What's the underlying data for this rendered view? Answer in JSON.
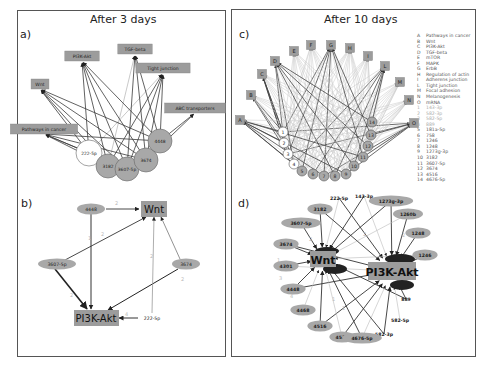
{
  "figure": {
    "left_title": "After 3 days",
    "right_title": "After 10 days",
    "panel_labels": {
      "a": "a)",
      "b": "b)",
      "c": "c)",
      "d": "d)"
    }
  },
  "panel_a": {
    "pathways": [
      {
        "label": "PI3K-Akt",
        "x": 82,
        "y": 56
      },
      {
        "label": "TGF-beta",
        "x": 135,
        "y": 49
      },
      {
        "label": "Tight junction",
        "x": 163,
        "y": 68
      },
      {
        "label": "Wnt",
        "x": 40,
        "y": 84
      },
      {
        "label": "ABC transporters",
        "x": 195,
        "y": 108
      },
      {
        "label": "Pathways in cancer",
        "x": 44,
        "y": 129
      }
    ],
    "mirnas": [
      {
        "label": "222-5p",
        "x": 89,
        "y": 153,
        "r": 13,
        "fill": "#ffffff"
      },
      {
        "label": "3182",
        "x": 108,
        "y": 166,
        "r": 12,
        "fill": "#a8a8a8"
      },
      {
        "label": "3607-5p",
        "x": 127,
        "y": 169,
        "r": 12,
        "fill": "#a8a8a8"
      },
      {
        "label": "3674",
        "x": 146,
        "y": 160,
        "r": 12,
        "fill": "#a8a8a8"
      },
      {
        "label": "4448",
        "x": 160,
        "y": 141,
        "r": 12,
        "fill": "#a8a8a8"
      }
    ]
  },
  "panel_b": {
    "targets": [
      {
        "label": "Wnt",
        "x": 154,
        "y": 209
      },
      {
        "label": "PI3K-Akt",
        "x": 96,
        "y": 318
      }
    ],
    "mirnas": [
      {
        "label": "4448",
        "x": 91,
        "y": 209
      },
      {
        "label": "3607-5p",
        "x": 57,
        "y": 264
      },
      {
        "label": "3674",
        "x": 186,
        "y": 264
      },
      {
        "label": "222-5p",
        "x": 152,
        "y": 318
      }
    ],
    "edge_weights": [
      "2",
      "2",
      "2",
      "2",
      "2",
      "4",
      "1"
    ]
  },
  "panel_c": {
    "pathway_nodes": [
      "A",
      "B",
      "C",
      "D",
      "E",
      "F",
      "G",
      "H",
      "I",
      "L",
      "M",
      "N",
      "O"
    ],
    "mirna_nodes": [
      "1",
      "2",
      "3",
      "4",
      "5",
      "6",
      "7",
      "8",
      "9",
      "10",
      "11",
      "12",
      "13",
      "14"
    ],
    "legend": [
      {
        "key": "A",
        "label": "Pathways in cancer"
      },
      {
        "key": "B",
        "label": "Wnt"
      },
      {
        "key": "C",
        "label": "PI3K-Akt"
      },
      {
        "key": "D",
        "label": "TGF-beta"
      },
      {
        "key": "E",
        "label": "mTOR"
      },
      {
        "key": "F",
        "label": "MAPK"
      },
      {
        "key": "G",
        "label": "ErbB"
      },
      {
        "key": "H",
        "label": "Regulation of actin"
      },
      {
        "key": "I",
        "label": "Adherens junction"
      },
      {
        "key": "L",
        "label": "Tight junction"
      },
      {
        "key": "M",
        "label": "Focal adhesion"
      },
      {
        "key": "N",
        "label": "Melanogenesis"
      },
      {
        "key": "O",
        "label": "mRNA"
      },
      {
        "key": "1",
        "label": "143-3p",
        "light": true
      },
      {
        "key": "2",
        "label": "582-3p",
        "light": true
      },
      {
        "key": "3",
        "label": "582-5p",
        "light": true
      },
      {
        "key": "4",
        "label": "889",
        "light": true
      },
      {
        "key": "5",
        "label": "181a-5p"
      },
      {
        "key": "6",
        "label": "758"
      },
      {
        "key": "7",
        "label": "1246"
      },
      {
        "key": "8",
        "label": "1248"
      },
      {
        "key": "9",
        "label": "1273g-3p"
      },
      {
        "key": "10",
        "label": "3182"
      },
      {
        "key": "11",
        "label": "3607-5p"
      },
      {
        "key": "12",
        "label": "3674"
      },
      {
        "key": "13",
        "label": "4516"
      },
      {
        "key": "14",
        "label": "4676-5p"
      }
    ]
  },
  "panel_d": {
    "hubs": [
      {
        "label": "Wnt",
        "x": 323,
        "y": 259
      },
      {
        "label": "PI3K-Akt",
        "x": 392,
        "y": 271
      }
    ],
    "mirnas": [
      {
        "label": "222-5p",
        "x": 339,
        "y": 198,
        "fill": "#ffffff"
      },
      {
        "label": "143-3p",
        "x": 364,
        "y": 196,
        "fill": "#ffffff"
      },
      {
        "label": "1273g-3p",
        "x": 391,
        "y": 201,
        "fill": "#a8a8a8"
      },
      {
        "label": "3182",
        "x": 320,
        "y": 209,
        "fill": "#a8a8a8"
      },
      {
        "label": "1260b",
        "x": 408,
        "y": 214,
        "fill": "#a8a8a8"
      },
      {
        "label": "3607-5p",
        "x": 301,
        "y": 223,
        "fill": "#a8a8a8"
      },
      {
        "label": "1248",
        "x": 418,
        "y": 233,
        "fill": "#a8a8a8"
      },
      {
        "label": "3674",
        "x": 286,
        "y": 244,
        "fill": "#a8a8a8"
      },
      {
        "label": "1246",
        "x": 425,
        "y": 255,
        "fill": "#a8a8a8"
      },
      {
        "label": "4301",
        "x": 286,
        "y": 266,
        "fill": "#a8a8a8"
      },
      {
        "label": "4448",
        "x": 293,
        "y": 289,
        "fill": "#a8a8a8"
      },
      {
        "label": "889",
        "x": 406,
        "y": 299,
        "fill": "#ffffff"
      },
      {
        "label": "4468",
        "x": 303,
        "y": 310,
        "fill": "#a8a8a8"
      },
      {
        "label": "582-5p",
        "x": 400,
        "y": 320,
        "fill": "#ffffff"
      },
      {
        "label": "4516",
        "x": 320,
        "y": 326,
        "fill": "#a8a8a8"
      },
      {
        "label": "582-3p",
        "x": 384,
        "y": 334,
        "fill": "#ffffff"
      },
      {
        "label": "4532",
        "x": 342,
        "y": 337,
        "fill": "#a8a8a8"
      },
      {
        "label": "4676-5p",
        "x": 362,
        "y": 338,
        "fill": "#a8a8a8"
      }
    ]
  },
  "colors": {
    "node_gray": "#a8a8a8",
    "box_gray": "#9c9c9c",
    "edge_dark": "#333333",
    "edge_light": "#bbbbbb",
    "frame": "#555555"
  }
}
